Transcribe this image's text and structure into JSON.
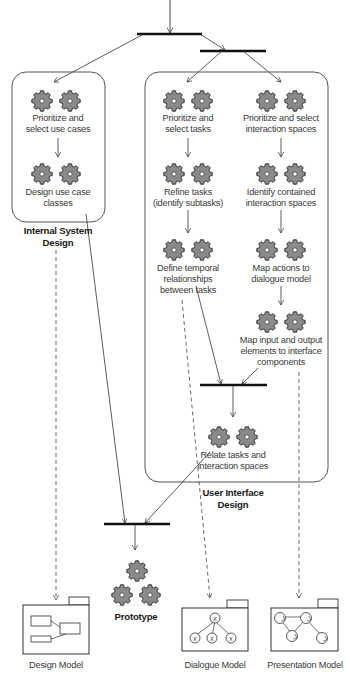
{
  "diagram": {
    "colors": {
      "line": "#333333",
      "gear_fill": "#8a8a8a",
      "gear_stroke": "#2a2a2a",
      "box_stroke": "#555555",
      "background": "#ffffff"
    },
    "groups": {
      "internal": {
        "title": "Internal System\nDesign"
      },
      "ui": {
        "title": "User Interface\nDesign"
      }
    },
    "activities": {
      "prioritize_use_cases": "Prioritize and\nselect use cases",
      "design_use_case_classes": "Design use case\nclasses",
      "prioritize_tasks": "Prioritize and\nselect tasks",
      "refine_tasks": "Refine tasks\n(identify subtasks)",
      "define_temporal": "Define temporal\nrelationships\nbetween tasks",
      "prioritize_interaction_spaces": "Prioritize and select\ninteraction spaces",
      "identify_contained": "Identify contained\ninteraction spaces",
      "map_actions": "Map actions to\ndialogue model",
      "map_io": "Map input and output\nelements to interface\ncomponents",
      "relate_tasks": "Relate tasks and\ninteraction spaces"
    },
    "prototype": {
      "label": "Prototype"
    },
    "models": [
      {
        "label": "Design Model",
        "icon": "class-diagram-icon"
      },
      {
        "label": "Dialogue Model",
        "icon": "task-tree-icon"
      },
      {
        "label": "Presentation Model",
        "icon": "interaction-space-graph-icon"
      }
    ]
  }
}
